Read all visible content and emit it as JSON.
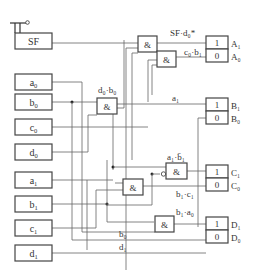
{
  "diagram": {
    "type": "logic-circuit",
    "switch": {
      "label": "SF"
    },
    "inputs": [
      {
        "base": "a",
        "sub": "0"
      },
      {
        "base": "b",
        "sub": "0"
      },
      {
        "base": "c",
        "sub": "0"
      },
      {
        "base": "d",
        "sub": "0"
      },
      {
        "base": "a",
        "sub": "1"
      },
      {
        "base": "b",
        "sub": "1"
      },
      {
        "base": "c",
        "sub": "1"
      },
      {
        "base": "d",
        "sub": "1"
      }
    ],
    "gates": [
      {
        "id": "g1",
        "symbol": "&"
      },
      {
        "id": "g2",
        "symbol": "&"
      },
      {
        "id": "g3",
        "symbol": "&"
      },
      {
        "id": "g4",
        "symbol": "&"
      },
      {
        "id": "g5",
        "symbol": "&"
      },
      {
        "id": "g6",
        "symbol": "&"
      }
    ],
    "wire_labels": {
      "sf_d0": "SF·d₀*",
      "c0_b1": "c₀·b₁",
      "d0_b0": "d₀·b₀",
      "a1": "a₁",
      "a1_notb1": "a₁·b̄₁",
      "b1_c1": "b₁·c₁",
      "b1_a0": "b₁·a₀",
      "b0": "b₀",
      "d1": "d₁"
    },
    "flipflops": [
      {
        "top": "1",
        "bottom": "0",
        "out_top": "A₁",
        "out_bottom": "A₀"
      },
      {
        "top": "1",
        "bottom": "0",
        "out_top": "B₁",
        "out_bottom": "B₀"
      },
      {
        "top": "1",
        "bottom": "0",
        "out_top": "C₁",
        "out_bottom": "C₀"
      },
      {
        "top": "1",
        "bottom": "0",
        "out_top": "D₁",
        "out_bottom": "D₀"
      }
    ]
  }
}
